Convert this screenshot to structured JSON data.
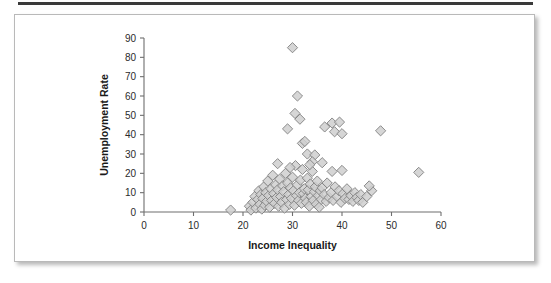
{
  "figure": {
    "background_color": "#ffffff",
    "border_color": "#b9b9b9",
    "rule_color": "#3a3a3a"
  },
  "chart_data": {
    "type": "scatter",
    "title": "",
    "xlabel": "Income Inequality",
    "ylabel": "Unemployment Rate",
    "xlim": [
      0,
      60
    ],
    "ylim": [
      0,
      90
    ],
    "xticks": [
      0,
      10,
      20,
      30,
      40,
      50,
      60
    ],
    "yticks": [
      0,
      10,
      20,
      30,
      40,
      50,
      60,
      70,
      80,
      90
    ],
    "grid": false,
    "legend": "none",
    "marker": {
      "shape": "diamond",
      "fill_color": "#cfcfcf",
      "edge_color": "#808080",
      "size": 7
    },
    "series": [
      {
        "name": "countries",
        "points": [
          [
            17.5,
            1.0
          ],
          [
            21.3,
            3.0
          ],
          [
            21.6,
            1.0
          ],
          [
            22.0,
            5.0
          ],
          [
            22.4,
            8.0
          ],
          [
            22.6,
            2.0
          ],
          [
            23.0,
            6.5
          ],
          [
            23.2,
            11.0
          ],
          [
            23.4,
            4.0
          ],
          [
            23.6,
            9.0
          ],
          [
            23.8,
            1.5
          ],
          [
            24.0,
            7.0
          ],
          [
            24.2,
            13.0
          ],
          [
            24.4,
            3.5
          ],
          [
            24.6,
            10.0
          ],
          [
            24.8,
            5.5
          ],
          [
            25.0,
            16.0
          ],
          [
            25.2,
            8.5
          ],
          [
            25.4,
            2.5
          ],
          [
            25.6,
            12.0
          ],
          [
            25.8,
            6.0
          ],
          [
            26.0,
            19.0
          ],
          [
            26.2,
            9.5
          ],
          [
            26.4,
            4.5
          ],
          [
            26.6,
            14.0
          ],
          [
            26.8,
            7.5
          ],
          [
            27.0,
            11.5
          ],
          [
            27.2,
            3.0
          ],
          [
            27.4,
            17.0
          ],
          [
            27.6,
            8.0
          ],
          [
            27.8,
            5.0
          ],
          [
            28.0,
            13.5
          ],
          [
            28.2,
            10.5
          ],
          [
            28.4,
            2.0
          ],
          [
            28.6,
            20.0
          ],
          [
            28.8,
            6.5
          ],
          [
            29.0,
            15.0
          ],
          [
            29.2,
            9.0
          ],
          [
            29.4,
            4.0
          ],
          [
            29.6,
            12.5
          ],
          [
            29.8,
            7.0
          ],
          [
            30.0,
            18.0
          ],
          [
            30.2,
            11.0
          ],
          [
            30.4,
            3.5
          ],
          [
            30.6,
            24.0
          ],
          [
            30.8,
            8.5
          ],
          [
            31.0,
            14.0
          ],
          [
            31.2,
            6.0
          ],
          [
            31.4,
            10.0
          ],
          [
            31.6,
            16.5
          ],
          [
            31.8,
            4.5
          ],
          [
            32.0,
            22.0
          ],
          [
            32.2,
            9.5
          ],
          [
            32.4,
            12.0
          ],
          [
            32.6,
            7.0
          ],
          [
            32.8,
            5.0
          ],
          [
            33.0,
            17.5
          ],
          [
            33.2,
            11.5
          ],
          [
            33.4,
            3.0
          ],
          [
            33.6,
            14.5
          ],
          [
            33.8,
            8.0
          ],
          [
            34.0,
            21.0
          ],
          [
            34.2,
            6.0
          ],
          [
            34.4,
            10.5
          ],
          [
            34.6,
            13.0
          ],
          [
            34.8,
            4.0
          ],
          [
            35.0,
            16.0
          ],
          [
            35.2,
            8.5
          ],
          [
            35.4,
            2.5
          ],
          [
            35.6,
            11.0
          ],
          [
            35.8,
            6.5
          ],
          [
            36.0,
            12.5
          ],
          [
            36.4,
            9.0
          ],
          [
            36.8,
            5.5
          ],
          [
            37.0,
            15.0
          ],
          [
            37.4,
            7.5
          ],
          [
            37.8,
            10.0
          ],
          [
            38.2,
            6.0
          ],
          [
            38.6,
            13.0
          ],
          [
            39.0,
            8.0
          ],
          [
            39.4,
            11.0
          ],
          [
            39.8,
            5.0
          ],
          [
            40.2,
            9.5
          ],
          [
            40.6,
            7.0
          ],
          [
            41.0,
            12.0
          ],
          [
            41.4,
            6.5
          ],
          [
            41.8,
            8.5
          ],
          [
            42.2,
            5.5
          ],
          [
            42.6,
            10.0
          ],
          [
            43.0,
            7.5
          ],
          [
            43.4,
            6.0
          ],
          [
            43.8,
            9.0
          ],
          [
            44.2,
            5.0
          ],
          [
            45.0,
            8.0
          ],
          [
            46.0,
            11.0
          ],
          [
            29.0,
            43.0
          ],
          [
            30.0,
            85.0
          ],
          [
            31.0,
            60.0
          ],
          [
            30.5,
            51.0
          ],
          [
            31.5,
            48.0
          ],
          [
            32.0,
            35.5
          ],
          [
            32.5,
            36.5
          ],
          [
            33.0,
            30.0
          ],
          [
            34.5,
            29.5
          ],
          [
            36.5,
            44.0
          ],
          [
            38.0,
            46.0
          ],
          [
            38.5,
            41.5
          ],
          [
            39.5,
            46.5
          ],
          [
            40.0,
            40.5
          ],
          [
            36.0,
            25.5
          ],
          [
            38.0,
            21.0
          ],
          [
            40.0,
            21.5
          ],
          [
            47.8,
            42.0
          ],
          [
            55.5,
            20.5
          ],
          [
            45.5,
            13.5
          ],
          [
            27.0,
            25.0
          ],
          [
            34.0,
            26.0
          ],
          [
            29.5,
            23.0
          ],
          [
            33.5,
            24.5
          ]
        ]
      }
    ]
  }
}
